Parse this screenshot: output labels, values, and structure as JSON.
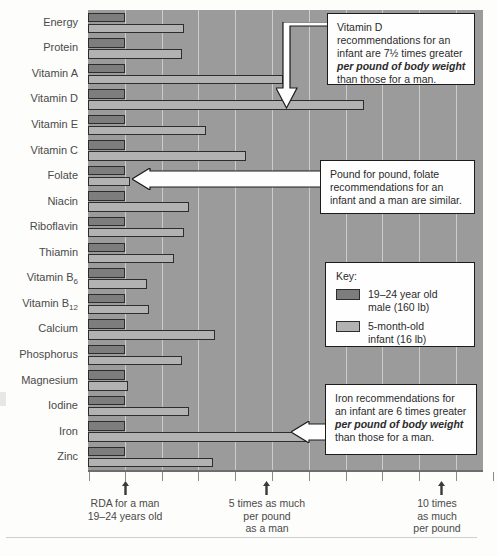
{
  "chart_data": {
    "type": "bar",
    "orientation": "horizontal",
    "title": "",
    "xlabel": "",
    "ylabel": "",
    "xlim": [
      0,
      11.3
    ],
    "grid": true,
    "gridlines_at": [
      1,
      2,
      3,
      4,
      5,
      6,
      7,
      8,
      9,
      10,
      11
    ],
    "legend_position": "inside-right",
    "categories": [
      "Energy",
      "Protein",
      "Vitamin A",
      "Vitamin D",
      "Vitamin E",
      "Vitamin C",
      "Folate",
      "Niacin",
      "Riboflavin",
      "Thiamin",
      "Vitamin B6",
      "Vitamin B12",
      "Calcium",
      "Phosphorus",
      "Magnesium",
      "Iodine",
      "Iron",
      "Zinc"
    ],
    "category_labels_html": [
      "Energy",
      "Protein",
      "Vitamin A",
      "Vitamin D",
      "Vitamin E",
      "Vitamin C",
      "Folate",
      "Niacin",
      "Riboflavin",
      "Thiamin",
      "Vitamin B<sub>6</sub>",
      "Vitamin B<sub>12</sub>",
      "Calcium",
      "Phosphorus",
      "Magnesium",
      "Iodine",
      "Iron",
      "Zinc"
    ],
    "series": [
      {
        "name": "19–24 year old male (160 lb)",
        "color": "#7d7d7d",
        "values": [
          1,
          1,
          1,
          1,
          1,
          1,
          1,
          1,
          1,
          1,
          1,
          1,
          1,
          1,
          1,
          1,
          1,
          1
        ]
      },
      {
        "name": "5-month-old infant (16 lb)",
        "color": "#b2b2b2",
        "values": [
          2.6,
          2.55,
          5.3,
          7.5,
          3.2,
          4.3,
          1.15,
          2.75,
          2.6,
          2.35,
          1.6,
          1.65,
          3.45,
          2.55,
          1.1,
          2.75,
          6.0,
          3.4
        ]
      }
    ],
    "xtick_values": [
      1,
      2,
      3,
      4,
      5,
      6,
      7,
      8,
      9,
      10,
      11
    ],
    "annotated_ticks": [
      {
        "value": 1,
        "label": "RDA for a man\n19–24 years old"
      },
      {
        "value": 5,
        "label": "5 times as much\nper pound\nas a man"
      },
      {
        "value": 10,
        "label": "10 times\nas much\nper pound"
      }
    ]
  },
  "axis": {
    "note_1_line1": "RDA for a man",
    "note_1_line2": "19–24 years old",
    "note_2_line1": "5 times as much",
    "note_2_line2": "per pound",
    "note_2_line3": "as a man",
    "note_3_line1": "10 times",
    "note_3_line2": "as much",
    "note_3_line3": "per pound"
  },
  "callouts": {
    "vitamin_d": {
      "p1": "Vitamin D recommendations for an infant are 7½ times greater ",
      "em": "per pound of body weight",
      "p2": " than those for a man."
    },
    "folate": {
      "p1": "Pound for pound, folate recommendations for an infant and a man are similar."
    },
    "iron": {
      "p1": "Iron recommendations for an infant are 6 times greater ",
      "em": "per pound of body weight",
      "p2": " than those for a man."
    }
  },
  "legend": {
    "title": "Key:",
    "items": [
      {
        "label_line1": "19–24 year old",
        "label_line2": "male (160 lb)",
        "color": "#7d7d7d"
      },
      {
        "label_line1": "5-month-old",
        "label_line2": "infant (16 lb)",
        "color": "#b2b2b2"
      }
    ]
  },
  "colors": {
    "plot_background": "#9b9b9b",
    "gridline": "#dcdcdc",
    "male_bar": "#7d7d7d",
    "infant_bar": "#b2b2b2",
    "bar_outline": "#2d2d2d",
    "callout_background": "#fefefe",
    "callout_border": "#1c1c1c",
    "page_background": "#fdfdfb",
    "text": "#3a3a3a"
  }
}
